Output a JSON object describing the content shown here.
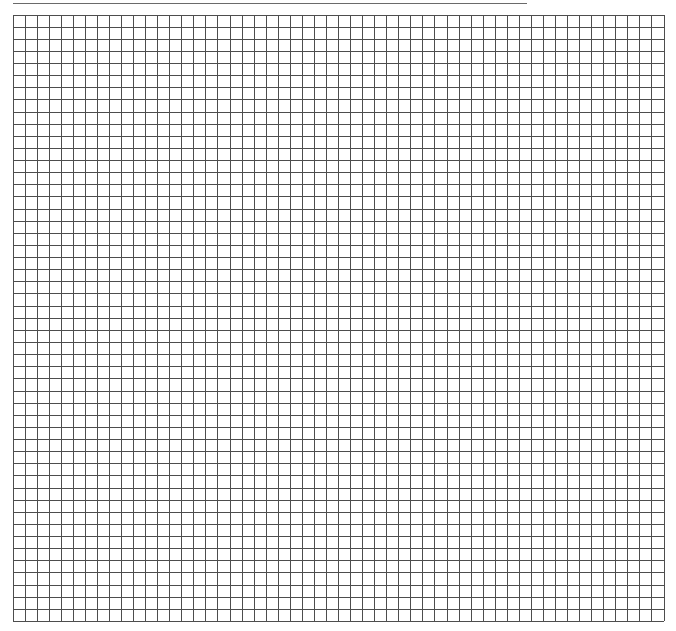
{
  "page": {
    "type": "graph-paper",
    "background_color": "#ffffff"
  },
  "top_rule": {
    "color": "#6a6a6a",
    "x_start": 13,
    "x_end": 527,
    "y": 3
  },
  "grid": {
    "columns": 54,
    "rows": 50,
    "cell_width": 12.06,
    "cell_height": 12.13,
    "left": 12.5,
    "top": 14,
    "width": 651,
    "height": 606.5,
    "line_color": "#4d4d4d",
    "line_width": 1
  }
}
